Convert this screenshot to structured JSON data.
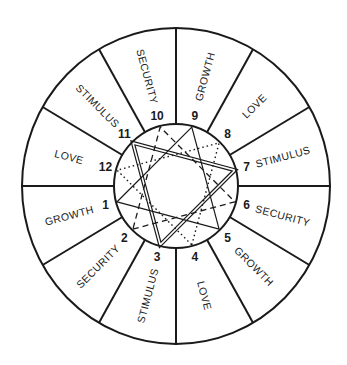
{
  "diagram": {
    "title": "",
    "center": {
      "x": 176,
      "y": 186
    },
    "outer_radius": {
      "rx": 154,
      "ry": 158
    },
    "inner_radius": 62,
    "houses": [
      {
        "number": "1",
        "label": "GROWTH",
        "angle": 195
      },
      {
        "number": "2",
        "label": "SECURITY",
        "angle": 225
      },
      {
        "number": "3",
        "label": "STIMULUS",
        "angle": 255
      },
      {
        "number": "4",
        "label": "LOVE",
        "angle": 285
      },
      {
        "number": "5",
        "label": "GROWTH",
        "angle": 315
      },
      {
        "number": "6",
        "label": "SECURITY",
        "angle": 345
      },
      {
        "number": "7",
        "label": "STIMULUS",
        "angle": 15
      },
      {
        "number": "8",
        "label": "LOVE",
        "angle": 45
      },
      {
        "number": "9",
        "label": "GROWTH",
        "angle": 75
      },
      {
        "number": "10",
        "label": "SECURITY",
        "angle": 105
      },
      {
        "number": "11",
        "label": "STIMULUS",
        "angle": 135
      },
      {
        "number": "12",
        "label": "LOVE",
        "angle": 165
      }
    ],
    "triangles": [
      {
        "name": "stimulus",
        "houses": [
          3,
          7,
          11
        ],
        "style": "double"
      },
      {
        "name": "growth",
        "houses": [
          1,
          5,
          9
        ],
        "style": "solid"
      },
      {
        "name": "security",
        "houses": [
          2,
          6,
          10
        ],
        "style": "dashed"
      },
      {
        "name": "love",
        "houses": [
          4,
          8,
          12
        ],
        "style": "dotted"
      }
    ]
  }
}
